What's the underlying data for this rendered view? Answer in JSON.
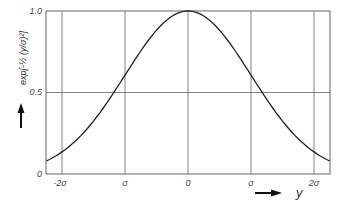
{
  "chart_data": {
    "type": "line",
    "title": "",
    "xlabel": "y",
    "ylabel": "exp[-½ (y/σ)²]",
    "x_ticks": [
      "-2σ",
      "σ",
      "0",
      "σ",
      "2σ"
    ],
    "x_tick_values": [
      -2,
      -1,
      0,
      1,
      2
    ],
    "y_ticks": [
      "0",
      "0.5",
      "1.0"
    ],
    "y_tick_values": [
      0,
      0.5,
      1.0
    ],
    "xlim": [
      -2.25,
      2.25
    ],
    "ylim": [
      0,
      1.0
    ],
    "grid": true,
    "legend": null,
    "series": [
      {
        "name": "exp[-½ (y/σ)²]",
        "x": [
          -2.25,
          -2.0,
          -1.75,
          -1.5,
          -1.25,
          -1.0,
          -0.75,
          -0.5,
          -0.25,
          0,
          0.25,
          0.5,
          0.75,
          1.0,
          1.25,
          1.5,
          1.75,
          2.0,
          2.25
        ],
        "values": [
          0.08,
          0.135,
          0.216,
          0.325,
          0.458,
          0.607,
          0.755,
          0.882,
          0.969,
          1.0,
          0.969,
          0.882,
          0.755,
          0.607,
          0.458,
          0.325,
          0.216,
          0.135,
          0.08
        ]
      }
    ]
  },
  "labels": {
    "y0": "0",
    "y05": "0.5",
    "y10": "1.0",
    "xm2": "-2σ",
    "xm1": "σ",
    "x0": "0",
    "xp1": "σ",
    "xp2": "2σ",
    "xaxis": "y",
    "yaxis": "exp[-½ (y/σ)²]"
  }
}
